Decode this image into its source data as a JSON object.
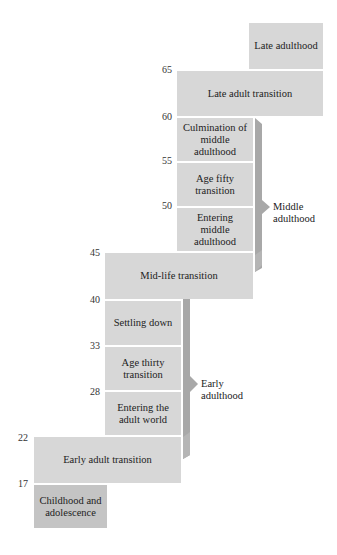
{
  "diagram": {
    "type": "life-stages-staircase",
    "ages": [
      "65",
      "60",
      "55",
      "50",
      "45",
      "40",
      "33",
      "28",
      "22",
      "17"
    ],
    "stages": [
      {
        "label": "Late adulthood"
      },
      {
        "label": "Late adult transition"
      },
      {
        "label": "Culmination of middle adulthood"
      },
      {
        "label": "Age fifty transition"
      },
      {
        "label": "Entering middle adulthood"
      },
      {
        "label": "Mid-life transition"
      },
      {
        "label": "Settling down"
      },
      {
        "label": "Age thirty transition"
      },
      {
        "label": "Entering the adult world"
      },
      {
        "label": "Early adult transition"
      },
      {
        "label": "Childhood and adolescence"
      }
    ],
    "brackets": [
      {
        "label_line1": "Middle",
        "label_line2": "adulthood"
      },
      {
        "label_line1": "Early",
        "label_line2": "adulthood"
      }
    ],
    "colors": {
      "box": "#d7d7d7",
      "box_dark": "#c4c4c4",
      "bracket": "#a8a8a8"
    }
  }
}
